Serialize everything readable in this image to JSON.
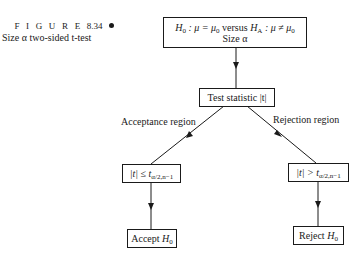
{
  "caption": {
    "figure_label": "F I G U R E",
    "figure_number": "8.34",
    "title": "Size α two-sided t-test"
  },
  "nodes": {
    "hypothesis": {
      "line1": "H₀ : μ = μ₀  versus  H_A : μ ≠ μ₀",
      "line1_parts": {
        "h0": "H",
        "h0_sub": "0",
        "mid1": " : μ = μ",
        "mu0_sub": "0",
        "versus": " versus ",
        "ha": "H",
        "ha_sub": "A",
        "mid2": " : μ ≠ μ",
        "mu0b_sub": "0"
      },
      "line2": "Size α"
    },
    "test_statistic": {
      "text": "Test statistic |t|"
    },
    "accept_condition": {
      "text": "|t| ≤ t_{α/2,n−1}",
      "lhs": "|t| ≤ t",
      "sub": "α/2,n−1"
    },
    "reject_condition": {
      "text": "|t| > t_{α/2,n−1}",
      "lhs": "|t| > t",
      "sub": "α/2,n−1"
    },
    "accept": {
      "text": "Accept H₀",
      "word": "Accept ",
      "h": "H",
      "sub": "0"
    },
    "reject": {
      "text": "Reject H₀",
      "word": "Reject ",
      "h": "H",
      "sub": "0"
    }
  },
  "edges": {
    "acceptance_label": "Acceptance region",
    "rejection_label": "Rejection region"
  }
}
